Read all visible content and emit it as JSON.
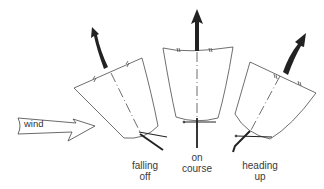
{
  "diagram": {
    "wind_label": "wind",
    "states": [
      {
        "id": "falling-off",
        "line1": "falling",
        "line2": "off"
      },
      {
        "id": "on-course",
        "line1": "on",
        "line2": "course"
      },
      {
        "id": "heading-up",
        "line1": "heading",
        "line2": "up"
      }
    ],
    "colors": {
      "line": "#4a4a4a",
      "arrow": "#222222",
      "background": "#ffffff"
    }
  }
}
